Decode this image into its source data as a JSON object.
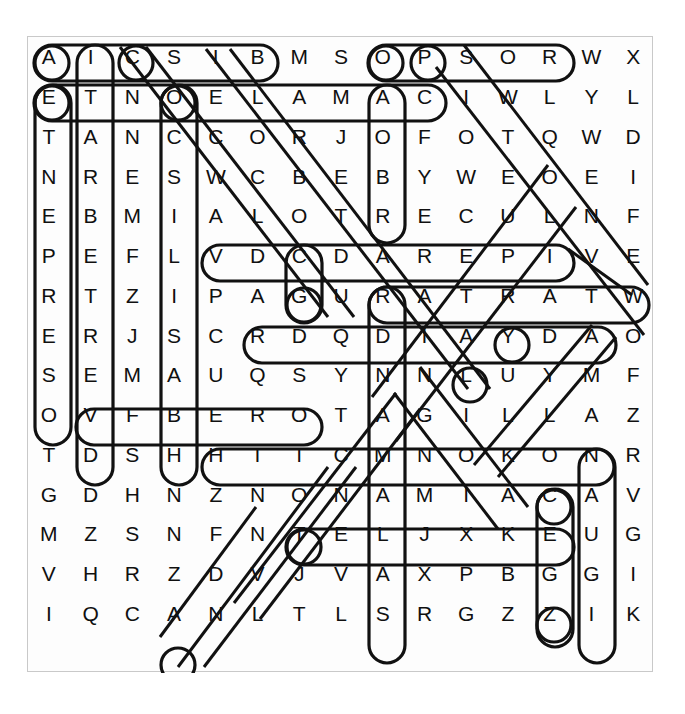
{
  "puzzle": {
    "type": "word-search",
    "columns": 15,
    "rows": 16,
    "border_color": "#c9c9c9",
    "letter_color": "#101010",
    "mark_color": "#111111",
    "grid_rows": [
      [
        "A",
        "I",
        "C",
        "S",
        "I",
        "B",
        "M",
        "S",
        "O",
        "P",
        "S",
        "O",
        "R",
        "W",
        "X"
      ],
      [
        "E",
        "T",
        "N",
        "O",
        "E",
        "L",
        "A",
        "M",
        "A",
        "C",
        "I",
        "W",
        "L",
        "Y",
        "L"
      ],
      [
        "T",
        "A",
        "N",
        "C",
        "C",
        "O",
        "R",
        "J",
        "O",
        "F",
        "O",
        "T",
        "Q",
        "W",
        "D"
      ],
      [
        "N",
        "R",
        "E",
        "S",
        "W",
        "C",
        "B",
        "E",
        "B",
        "Y",
        "W",
        "E",
        "O",
        "E",
        "I"
      ],
      [
        "E",
        "B",
        "M",
        "I",
        "A",
        "L",
        "O",
        "T",
        "R",
        "E",
        "C",
        "U",
        "L",
        "N",
        "F"
      ],
      [
        "P",
        "E",
        "F",
        "L",
        "V",
        "D",
        "C",
        "D",
        "A",
        "R",
        "E",
        "P",
        "I",
        "V",
        "E"
      ],
      [
        "R",
        "T",
        "Z",
        "I",
        "P",
        "A",
        "G",
        "U",
        "R",
        "A",
        "T",
        "R",
        "A",
        "T",
        "W"
      ],
      [
        "E",
        "R",
        "J",
        "S",
        "C",
        "R",
        "D",
        "Q",
        "D",
        "I",
        "A",
        "Y",
        "D",
        "A",
        "O"
      ],
      [
        "S",
        "E",
        "M",
        "A",
        "U",
        "Q",
        "S",
        "Y",
        "N",
        "N",
        "L",
        "U",
        "Y",
        "M",
        "F"
      ],
      [
        "O",
        "V",
        "F",
        "B",
        "E",
        "R",
        "O",
        "T",
        "A",
        "G",
        "I",
        "L",
        "L",
        "A",
        "Z"
      ],
      [
        "T",
        "D",
        "S",
        "H",
        "H",
        "T",
        "I",
        "C",
        "M",
        "N",
        "O",
        "K",
        "O",
        "N",
        "R"
      ],
      [
        "G",
        "D",
        "H",
        "N",
        "Z",
        "N",
        "O",
        "N",
        "A",
        "M",
        "I",
        "A",
        "C",
        "A",
        "V"
      ],
      [
        "M",
        "Z",
        "S",
        "N",
        "F",
        "N",
        "T",
        "E",
        "L",
        "J",
        "X",
        "K",
        "E",
        "U",
        "G"
      ],
      [
        "V",
        "H",
        "R",
        "Z",
        "D",
        "V",
        "J",
        "V",
        "A",
        "X",
        "P",
        "B",
        "G",
        "G",
        "I"
      ],
      [
        "I",
        "Q",
        "C",
        "A",
        "N",
        "L",
        "T",
        "L",
        "S",
        "R",
        "G",
        "Z",
        "Z",
        "I",
        "K"
      ]
    ],
    "found_words": [
      {
        "label": "BISCIA",
        "direction": "horizontal-left",
        "start_row": 0,
        "start_col": 0,
        "end_col": 5
      },
      {
        "label": "PSOR",
        "direction": "horizontal-left",
        "start_row": 0,
        "start_col": 8,
        "end_col": 12
      },
      {
        "label": "CAMALEONTE",
        "direction": "horizontal-left",
        "start_row": 1,
        "start_col": 0,
        "end_col": 9
      },
      {
        "label": "ALOTRECUL",
        "direction": "horizontal-left",
        "start_row": 4,
        "start_col": 4,
        "end_col": 12
      },
      {
        "label": "VIPERA",
        "direction": "horizontal-left",
        "start_row": 5,
        "start_col": 8,
        "end_col": 14
      },
      {
        "label": "TARTARUGA",
        "direction": "horizontal-left",
        "start_row": 6,
        "start_col": 5,
        "end_col": 13
      },
      {
        "label": "SQUAME",
        "direction": "horizontal-left",
        "start_row": 8,
        "start_col": 1,
        "end_col": 6
      },
      {
        "label": "ALLIGATORE",
        "direction": "horizontal-left",
        "start_row": 9,
        "start_col": 4,
        "end_col": 13
      },
      {
        "label": "CAIMANO",
        "direction": "horizontal-left",
        "start_row": 11,
        "start_col": 6,
        "end_col": 12
      },
      {
        "label": "SERPENTE",
        "direction": "vertical",
        "start_col": 0,
        "start_row": 1,
        "end_row": 8
      },
      {
        "label": "VERTEBRATI",
        "direction": "vertical",
        "start_col": 1,
        "start_row": 0,
        "end_row": 9
      },
      {
        "label": "SILICE",
        "direction": "vertical",
        "start_col": 3,
        "start_row": 1,
        "end_row": 9
      },
      {
        "label": "COCCODRILLO",
        "direction": "vertical",
        "start_col": 6,
        "start_row": 4,
        "end_row": 5
      },
      {
        "label": "AMBIENTE",
        "direction": "vertical",
        "start_col": 8,
        "start_row": 1,
        "end_row": 3
      },
      {
        "label": "AGAMA",
        "direction": "vertical",
        "start_col": 8,
        "start_row": 5,
        "end_row": 14
      },
      {
        "label": "RETTILE",
        "direction": "vertical",
        "start_col": 12,
        "start_row": 10,
        "end_row": 13
      },
      {
        "label": "IGUANA",
        "direction": "vertical",
        "start_col": 13,
        "start_row": 9,
        "end_row": 14
      },
      {
        "label": "ANACONDA",
        "direction": "diagonal-down-right",
        "start_row": 0,
        "start_col": 2
      },
      {
        "label": "LUCERTOLA",
        "direction": "diagonal-down-right",
        "start_row": 0,
        "start_col": 4
      },
      {
        "label": "GECO",
        "direction": "diagonal-down-right",
        "start_row": 0,
        "start_col": 9
      },
      {
        "label": "PITONE",
        "direction": "diagonal-down-right",
        "start_row": 0,
        "start_col": 10
      },
      {
        "label": "COBRA",
        "direction": "diagonal-up-right",
        "start_row": 14,
        "start_col": 3
      },
      {
        "label": "BOA",
        "direction": "diagonal-up-right",
        "start_row": 13,
        "start_col": 4
      },
      {
        "label": "VARANO",
        "direction": "diagonal-down-left",
        "start_row": 8,
        "start_col": 9
      },
      {
        "label": "TUATARA",
        "direction": "diagonal-down-left",
        "start_row": 6,
        "start_col": 13
      }
    ],
    "circled_letters": [
      {
        "row": 0,
        "col": 0,
        "letter": "A"
      },
      {
        "row": 0,
        "col": 2,
        "letter": "C"
      },
      {
        "row": 0,
        "col": 8,
        "letter": "O"
      },
      {
        "row": 0,
        "col": 9,
        "letter": "P"
      },
      {
        "row": 1,
        "col": 0,
        "letter": "E"
      },
      {
        "row": 1,
        "col": 3,
        "letter": "O"
      },
      {
        "row": 5,
        "col": 6,
        "letter": "C"
      },
      {
        "row": 6,
        "col": 11,
        "letter": "R"
      },
      {
        "row": 7,
        "col": 10,
        "letter": "A"
      },
      {
        "row": 10,
        "col": 12,
        "letter": "O"
      },
      {
        "row": 11,
        "col": 6,
        "letter": "O"
      },
      {
        "row": 13,
        "col": 12,
        "letter": "G"
      },
      {
        "row": 14,
        "col": 3,
        "letter": "A"
      }
    ]
  }
}
